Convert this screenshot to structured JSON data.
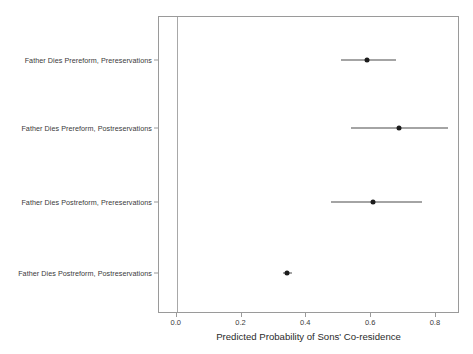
{
  "chart_data": {
    "type": "scatter",
    "title": "",
    "xlabel": "Predicted Probability of Sons' Co-residence",
    "ylabel": "",
    "xlim": [
      -0.055,
      0.875
    ],
    "xticks": [
      0.0,
      0.2,
      0.4,
      0.6,
      0.8
    ],
    "xtick_labels": [
      "0.0",
      "0.2",
      "0.4",
      "0.6",
      "0.8"
    ],
    "grid": false,
    "legend": "none",
    "reference_line_x": 0.0,
    "categories": [
      "Father Dies Prereform, Prereservations",
      "Father Dies Prereform, Postreservations",
      "Father Dies Postreform, Prereservations",
      "Father Dies Postreform, Postreservations"
    ],
    "points": [
      {
        "label": "Father Dies Prereform, Prereservations",
        "estimate": 0.59,
        "ci_low": 0.51,
        "ci_high": 0.68
      },
      {
        "label": "Father Dies Prereform, Postreservations",
        "estimate": 0.69,
        "ci_low": 0.54,
        "ci_high": 0.84
      },
      {
        "label": "Father Dies Postreform, Prereservations",
        "estimate": 0.61,
        "ci_low": 0.48,
        "ci_high": 0.76
      },
      {
        "label": "Father Dies Postreform, Postreservations",
        "estimate": 0.345,
        "ci_low": 0.33,
        "ci_high": 0.36
      }
    ],
    "colors": {
      "point": "#1c1c1c",
      "interval": "#4a4a4a",
      "axis": "#9a9a9a",
      "background": "#ffffff"
    }
  }
}
